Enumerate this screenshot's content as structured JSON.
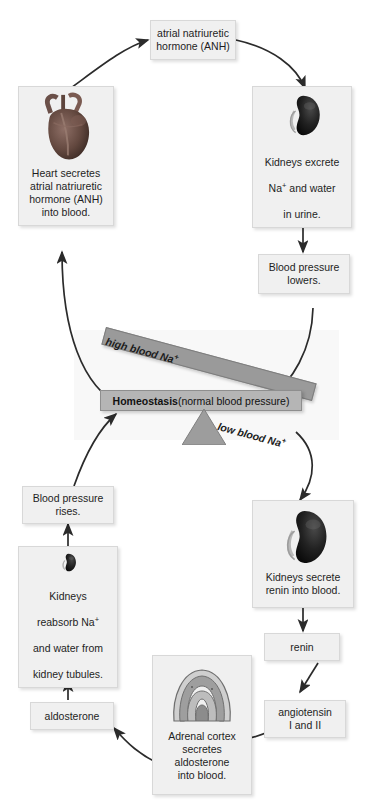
{
  "diagram": {
    "colors": {
      "box_fill": "#f0f0f0",
      "box_border": "#d8d8d8",
      "beam_fill": "#9a9a9a",
      "homeostasis_bar_fill": "#b5b5b5",
      "arrow": "#2b2b2b",
      "background": "#ffffff"
    },
    "nodes": {
      "anh_hormone": {
        "label": "atrial natriuretic\nhormone (ANH)"
      },
      "heart": {
        "label": "Heart secretes\natrial natriuretic\nhormone (ANH)\ninto blood.",
        "icon": "heart-organ-image"
      },
      "kidneys_excrete": {
        "label_line1": "Kidneys excrete",
        "label_line2_pre": "Na",
        "label_line2_sup": "+",
        "label_line2_post": " and water",
        "label_line3": "in urine.",
        "icon": "kidney-organ-image"
      },
      "bp_lowers": {
        "label": "Blood pressure\nlowers."
      },
      "bp_rises": {
        "label": "Blood pressure\nrises."
      },
      "kidneys_reabsorb": {
        "label_line1": "Kidneys",
        "label_line2_pre": "reabsorb Na",
        "label_line2_sup": "+",
        "label_line3": "and water from",
        "label_line4": "kidney tubules.",
        "icon": "kidney-organ-image"
      },
      "kidneys_renin": {
        "label": "Kidneys secrete\nrenin into blood.",
        "icon": "kidney-organ-image"
      },
      "renin": {
        "label": "renin"
      },
      "angiotensin": {
        "label": "angiotensin\nI and II"
      },
      "adrenal_cortex": {
        "label": "Adrenal cortex\nsecretes\naldosterone\ninto blood.",
        "icon": "adrenal-cortex-image"
      },
      "aldosterone": {
        "label": "aldosterone"
      }
    },
    "balance": {
      "high_label_pre": "high blood Na",
      "high_label_sup": "+",
      "low_label_pre": "low blood Na",
      "low_label_sup": "+",
      "homeostasis_bold": "Homeostasis",
      "homeostasis_rest": " (normal blood pressure)"
    }
  }
}
